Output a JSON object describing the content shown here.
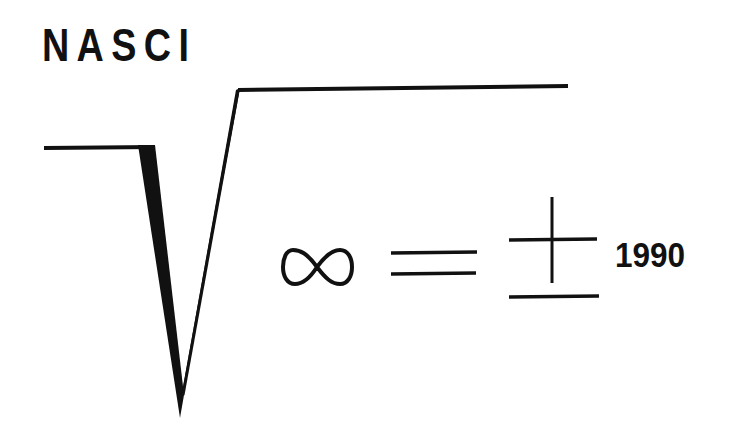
{
  "logo": {
    "org_name": "NASCI",
    "year": "1990",
    "symbols": {
      "radical": "square-root-sign",
      "infinity": "infinity-sign",
      "equals": "equals-sign",
      "plus_minus": "plus-minus-sign"
    },
    "formula_text": "√∞ = ± 1990",
    "colors": {
      "ink": "#111111",
      "background": "#ffffff"
    }
  }
}
